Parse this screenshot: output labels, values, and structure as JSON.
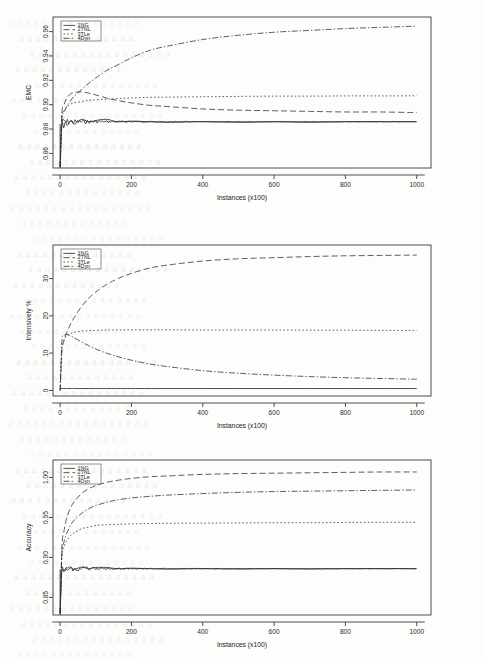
{
  "page": {
    "background_color": "#fdfdfc",
    "ink_color": "#2a2a2a",
    "bleed_color": "#e7e6e2",
    "bleed_text": [
      "a a a a a a a a a a a a a a a a",
      "a a a a a a a a a a a a a a",
      "a a a a a a a a a a a a a a a a a",
      "a a a a a a a a a a a a a",
      "a a a a a a a a a a a a a a a a",
      "a a a a a a a a a a a a a a",
      "a a a a a a a a a a a a a a a a a",
      "a a a a a a a a a a a a a",
      "a a a a a a a a a a a a a a a",
      "a a a a a a a a a a a a a a a a"
    ]
  },
  "common": {
    "xlabel": "Instances (x100)",
    "xticks": [
      0,
      200,
      400,
      600,
      800,
      1000
    ],
    "xlim": [
      -20,
      1040
    ],
    "legend_labels": [
      "1NG",
      "2TNL",
      "3TLe",
      "4Dyn"
    ],
    "legend_dash": [
      "none",
      "6 3",
      "1.6 2.2",
      "6 2 1.4 2"
    ]
  },
  "chart_data": [
    {
      "id": "emc",
      "type": "line",
      "title": "",
      "xlabel": "Instances (x100)",
      "ylabel": "EMC",
      "xlim": [
        -20,
        1040
      ],
      "ylim": [
        0.848,
        0.972
      ],
      "xticks": [
        0,
        200,
        400,
        600,
        800,
        1000
      ],
      "yticks": [
        0.86,
        0.88,
        0.9,
        0.92,
        0.94,
        0.96
      ],
      "ytick_labels": [
        "0.86",
        "0.88",
        "0.90",
        "0.92",
        "0.94",
        "0.96"
      ],
      "grid": false,
      "legend_position": "top-left",
      "x": [
        0,
        5,
        10,
        15,
        20,
        30,
        40,
        60,
        80,
        100,
        130,
        160,
        200,
        250,
        300,
        400,
        500,
        600,
        700,
        800,
        900,
        1000
      ],
      "series": [
        {
          "name": "1NG",
          "dash": "none",
          "values": [
            0.849,
            0.884,
            0.881,
            0.886,
            0.883,
            0.887,
            0.884,
            0.888,
            0.886,
            0.887,
            0.888,
            0.886,
            0.8865,
            0.886,
            0.8855,
            0.886,
            0.8855,
            0.886,
            0.8855,
            0.886,
            0.886,
            0.886
          ]
        },
        {
          "name": "2TNL",
          "dash": "6 3",
          "values": [
            0.849,
            0.893,
            0.899,
            0.903,
            0.906,
            0.909,
            0.91,
            0.9105,
            0.9095,
            0.908,
            0.9055,
            0.9035,
            0.9015,
            0.8995,
            0.8985,
            0.8965,
            0.8955,
            0.895,
            0.8945,
            0.894,
            0.894,
            0.8935
          ]
        },
        {
          "name": "3TLe",
          "dash": "1.6 2.2",
          "values": [
            0.849,
            0.891,
            0.8945,
            0.897,
            0.8985,
            0.9005,
            0.9015,
            0.9025,
            0.9035,
            0.904,
            0.9045,
            0.905,
            0.9055,
            0.906,
            0.9062,
            0.9065,
            0.9068,
            0.907,
            0.907,
            0.9072,
            0.9072,
            0.9073
          ]
        },
        {
          "name": "4Dyn",
          "dash": "6 2 1.4 2",
          "values": [
            0.849,
            0.889,
            0.893,
            0.8965,
            0.899,
            0.9035,
            0.907,
            0.9125,
            0.9175,
            0.922,
            0.928,
            0.9325,
            0.9385,
            0.9445,
            0.948,
            0.9535,
            0.957,
            0.9595,
            0.961,
            0.9625,
            0.9635,
            0.9645
          ]
        }
      ]
    },
    {
      "id": "intensively",
      "type": "line",
      "title": "",
      "xlabel": "Instances (x100)",
      "ylabel": "Intensively %",
      "xlim": [
        -20,
        1040
      ],
      "ylim": [
        -1.5,
        39
      ],
      "xticks": [
        0,
        200,
        400,
        600,
        800,
        1000
      ],
      "yticks": [
        0,
        10,
        20,
        30
      ],
      "ytick_labels": [
        "0",
        "10",
        "20",
        "30"
      ],
      "grid": false,
      "legend_position": "top-left",
      "x": [
        0,
        5,
        10,
        15,
        20,
        30,
        40,
        60,
        80,
        100,
        130,
        160,
        200,
        250,
        300,
        400,
        500,
        600,
        700,
        800,
        900,
        1000
      ],
      "series": [
        {
          "name": "1NG",
          "dash": "none",
          "values": [
            0.5,
            0.5,
            0.5,
            0.5,
            0.5,
            0.5,
            0.5,
            0.5,
            0.5,
            0.5,
            0.5,
            0.5,
            0.5,
            0.5,
            0.5,
            0.5,
            0.5,
            0.5,
            0.5,
            0.5,
            0.5,
            0.5
          ]
        },
        {
          "name": "2TNL",
          "dash": "6 3",
          "values": [
            0.0,
            10.5,
            13.0,
            14.6,
            15.8,
            17.9,
            19.6,
            22.5,
            24.7,
            26.4,
            28.4,
            29.9,
            31.4,
            32.8,
            33.6,
            34.7,
            35.3,
            35.6,
            35.9,
            36.1,
            36.2,
            36.3
          ]
        },
        {
          "name": "3TLe",
          "dash": "1.6 2.2",
          "values": [
            0.0,
            11.5,
            13.4,
            14.3,
            14.8,
            15.3,
            15.6,
            15.9,
            16.0,
            16.1,
            16.2,
            16.2,
            16.25,
            16.25,
            16.25,
            16.2,
            16.2,
            16.2,
            16.15,
            16.15,
            16.1,
            16.1
          ]
        },
        {
          "name": "4Dyn",
          "dash": "6 2 1.4 2",
          "values": [
            0.0,
            13.2,
            14.6,
            15.0,
            15.0,
            14.6,
            14.1,
            13.0,
            12.0,
            11.1,
            10.0,
            9.1,
            8.1,
            7.1,
            6.4,
            5.3,
            4.6,
            4.1,
            3.7,
            3.4,
            3.2,
            3.0
          ]
        }
      ]
    },
    {
      "id": "accuracy",
      "type": "line",
      "title": "",
      "xlabel": "Instances (x100)",
      "ylabel": "Accuracy",
      "xlim": [
        -20,
        1040
      ],
      "ylim": [
        0.828,
        1.022
      ],
      "xticks": [
        0,
        200,
        400,
        600,
        800,
        1000
      ],
      "yticks": [
        0.85,
        0.9,
        0.95,
        1.0
      ],
      "ytick_labels": [
        "0.85",
        "0.90",
        "0.95",
        "1.00"
      ],
      "grid": false,
      "legend_position": "top-left",
      "x": [
        0,
        5,
        10,
        15,
        20,
        30,
        40,
        60,
        80,
        100,
        130,
        160,
        200,
        250,
        300,
        400,
        500,
        600,
        700,
        800,
        900,
        1000
      ],
      "series": [
        {
          "name": "1NG",
          "dash": "none",
          "values": [
            0.83,
            0.885,
            0.882,
            0.886,
            0.884,
            0.887,
            0.885,
            0.888,
            0.886,
            0.8875,
            0.8875,
            0.886,
            0.8865,
            0.886,
            0.8855,
            0.886,
            0.8855,
            0.886,
            0.8855,
            0.886,
            0.886,
            0.886
          ]
        },
        {
          "name": "2TNL",
          "dash": "6 3",
          "values": [
            0.83,
            0.913,
            0.931,
            0.943,
            0.952,
            0.963,
            0.97,
            0.98,
            0.986,
            0.99,
            0.994,
            0.9965,
            0.999,
            1.001,
            1.002,
            1.004,
            1.005,
            1.0055,
            1.006,
            1.0065,
            1.007,
            1.007
          ]
        },
        {
          "name": "3TLe",
          "dash": "1.6 2.2",
          "values": [
            0.83,
            0.902,
            0.912,
            0.918,
            0.922,
            0.928,
            0.931,
            0.936,
            0.938,
            0.94,
            0.941,
            0.9415,
            0.942,
            0.9425,
            0.9428,
            0.943,
            0.9432,
            0.9435,
            0.9435,
            0.9438,
            0.944,
            0.944
          ]
        },
        {
          "name": "4Dyn",
          "dash": "6 2 1.4 2",
          "values": [
            0.83,
            0.905,
            0.918,
            0.926,
            0.932,
            0.941,
            0.947,
            0.955,
            0.961,
            0.965,
            0.969,
            0.972,
            0.9745,
            0.9765,
            0.978,
            0.98,
            0.9815,
            0.9825,
            0.983,
            0.9835,
            0.984,
            0.9845
          ]
        }
      ]
    }
  ]
}
